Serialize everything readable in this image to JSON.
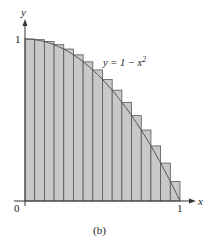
{
  "figure": {
    "caption": "(b)",
    "curve_label": "y = 1 − x",
    "curve_exponent": "2",
    "axis_x_label": "x",
    "axis_y_label": "y",
    "tick_origin": "0",
    "tick_x_one": "1",
    "tick_y_one": "1",
    "colors": {
      "bar_fill": "#c8c8c8",
      "bar_stroke": "#555555",
      "axis": "#333333"
    }
  },
  "chart_data": {
    "type": "bar",
    "title": "",
    "xlabel": "x",
    "ylabel": "y",
    "annotation": "y = 1 - x^2",
    "caption": "(b)",
    "n_rectangles": 16,
    "xlim": [
      0,
      1
    ],
    "ylim": [
      0,
      1
    ],
    "x_left_endpoints": [
      0,
      0.0625,
      0.125,
      0.1875,
      0.25,
      0.3125,
      0.375,
      0.4375,
      0.5,
      0.5625,
      0.625,
      0.6875,
      0.75,
      0.8125,
      0.875,
      0.9375
    ],
    "values": [
      1.0,
      0.996,
      0.984,
      0.965,
      0.938,
      0.902,
      0.859,
      0.809,
      0.75,
      0.684,
      0.609,
      0.527,
      0.438,
      0.34,
      0.234,
      0.121
    ]
  }
}
